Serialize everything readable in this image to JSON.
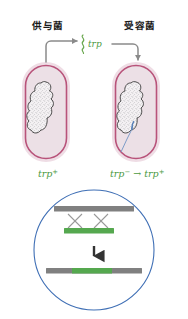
{
  "figure": {
    "background": "#ffffff"
  },
  "cells": {
    "donor": {
      "label": "供与菌",
      "genotype": "trp",
      "genotype_superscript": "+",
      "wall_color": "#b8537a",
      "rim_color": "#efdde5",
      "cytoplasm_color": "#ece0e6",
      "nucleoid_outline": "#3a3a3a"
    },
    "recipient": {
      "label": "受容菌",
      "genotype_before": "trp",
      "genotype_before_superscript": "−",
      "genotype_arrow": "→",
      "genotype_after": "trp",
      "genotype_after_superscript": "+",
      "wall_color": "#b8537a",
      "rim_color": "#efdde5",
      "cytoplasm_color": "#ece0e6",
      "nucleoid_outline": "#3a3a3a"
    }
  },
  "fragment": {
    "label": "trp",
    "color": "#6aa84f",
    "description": "free DNA fragment carrying trp gene"
  },
  "arrows": {
    "color": "#8a8a8a",
    "out_of_donor": "arrow from donor cell to fragment",
    "into_recipient": "arrow from fragment into recipient cell"
  },
  "inset": {
    "circle_color": "#3f6fb5",
    "callout_color": "#8fa9cf",
    "recipient_chromosome": {
      "label": "trp",
      "superscript": "−",
      "color": "#808080"
    },
    "donor_fragment": {
      "label": "trp",
      "superscript": "+",
      "color": "#55a84f"
    },
    "crossover_marks": 2,
    "crossover_color": "#9a9a9a",
    "down_arrow_color": "#333333",
    "result_chromosome": {
      "label": "trp",
      "superscript": "+",
      "flank_color": "#808080",
      "insert_color": "#55a84f"
    }
  }
}
